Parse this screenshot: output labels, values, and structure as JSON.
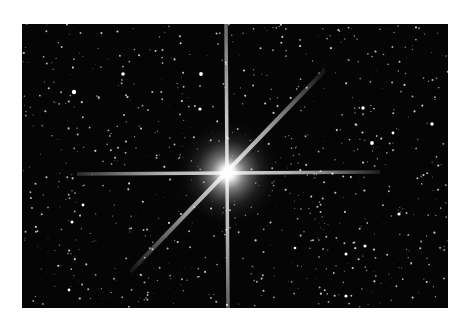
{
  "image": {
    "subject": "bright star with diffraction spikes in a dense star field",
    "background_color": "#ffffff",
    "sky_color": "#050505",
    "star_color": "#ffffff",
    "frame": {
      "x": 22,
      "y": 24,
      "width": 426,
      "height": 284
    },
    "main_star": {
      "cx": 206,
      "cy": 149,
      "glow_radius": 55
    },
    "spikes": {
      "horizontal": {
        "x1": 55,
        "y1": 150,
        "x2": 358,
        "y2": 148
      },
      "vertical": {
        "x1": 204,
        "y1": 0,
        "x2": 206,
        "y2": 284
      },
      "diagonal": {
        "x1": 108,
        "y1": 248,
        "x2": 303,
        "y2": 46
      }
    },
    "bright_stars": [
      {
        "x": 52,
        "y": 68,
        "r": 2.2
      },
      {
        "x": 101,
        "y": 50,
        "r": 1.8
      },
      {
        "x": 179,
        "y": 50,
        "r": 1.9
      },
      {
        "x": 178,
        "y": 85,
        "r": 1.6
      },
      {
        "x": 341,
        "y": 84,
        "r": 1.7
      },
      {
        "x": 350,
        "y": 119,
        "r": 1.9
      },
      {
        "x": 410,
        "y": 100,
        "r": 1.7
      },
      {
        "x": 371,
        "y": 109,
        "r": 1.4
      },
      {
        "x": 50,
        "y": 198,
        "r": 1.5
      },
      {
        "x": 61,
        "y": 181,
        "r": 1.4
      },
      {
        "x": 377,
        "y": 190,
        "r": 1.6
      },
      {
        "x": 343,
        "y": 222,
        "r": 1.6
      },
      {
        "x": 324,
        "y": 230,
        "r": 1.5
      },
      {
        "x": 324,
        "y": 272,
        "r": 1.6
      },
      {
        "x": 273,
        "y": 224,
        "r": 1.3
      },
      {
        "x": 47,
        "y": 266,
        "r": 1.4
      }
    ],
    "faint_star_count": 900
  }
}
